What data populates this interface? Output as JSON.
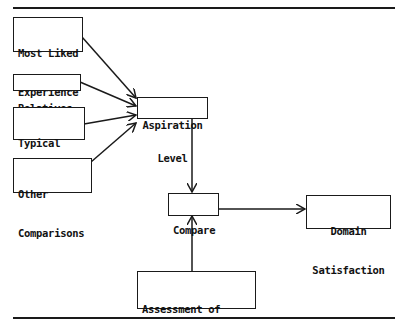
{
  "diagram": {
    "type": "flow-diagram",
    "nodes": {
      "most_liked": {
        "line1": "Most Liked",
        "line2": "Experience"
      },
      "relatives": {
        "line1": "Relatives"
      },
      "typical_american": {
        "line1": "Typical",
        "line2": "American"
      },
      "other_comparisons": {
        "line1": "Other",
        "line2": "Comparisons"
      },
      "aspiration_level": {
        "line1": "Aspiration",
        "line2": "Level"
      },
      "compare": {
        "line1": "Compare"
      },
      "domain_satisfaction": {
        "line1": "Domain",
        "line2": "Satisfaction"
      },
      "assessment": {
        "line1": "Assessment of",
        "line2": "Current Situation"
      }
    },
    "edges": [
      {
        "from": "Most Liked Experience",
        "to": "Aspiration Level"
      },
      {
        "from": "Relatives",
        "to": "Aspiration Level"
      },
      {
        "from": "Typical American",
        "to": "Aspiration Level"
      },
      {
        "from": "Other Comparisons",
        "to": "Aspiration Level"
      },
      {
        "from": "Aspiration Level",
        "to": "Compare"
      },
      {
        "from": "Assessment of Current Situation",
        "to": "Compare"
      },
      {
        "from": "Compare",
        "to": "Domain Satisfaction"
      }
    ]
  }
}
